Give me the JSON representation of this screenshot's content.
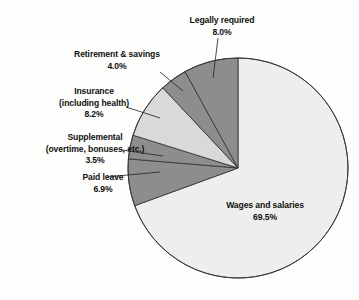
{
  "chart_data": {
    "type": "pie",
    "title": "",
    "subtitle": "",
    "xlabel": "",
    "ylabel": "",
    "legend_position": "none",
    "grid": false,
    "start_angle_deg": 0,
    "direction": "clockwise",
    "units": "percent of total compensation",
    "categories": [
      "Wages and salaries",
      "Paid leave",
      "Supplemental (overtime, bonuses, etc.)",
      "Insurance (including health)",
      "Retirement & savings",
      "Legally required"
    ],
    "values": [
      69.5,
      6.9,
      3.5,
      8.2,
      4.0,
      8.0
    ],
    "slices": [
      {
        "name": "Wages and salaries",
        "value": 69.5,
        "value_label": "69.5%",
        "label_line1": "Wages and salaries",
        "label_line2": "",
        "label_line3": "69.5%",
        "color": "#eeeeee",
        "label_placement": "inside",
        "label_x": 265,
        "label_y": 208,
        "leader": null
      },
      {
        "name": "Paid leave",
        "value": 6.9,
        "value_label": "6.9%",
        "label_line1": "Paid leave",
        "label_line2": "",
        "label_line3": "6.9%",
        "color": "#8d8d8d",
        "label_placement": "outside-left",
        "label_x": 103,
        "label_y": 180,
        "leader": {
          "x1": 107,
          "y1": 177,
          "x2": 160,
          "y2": 172
        }
      },
      {
        "name": "Supplemental",
        "value": 3.5,
        "value_label": "3.5%",
        "label_line1": "Supplemental",
        "label_line2": "(overtime, bonuses, etc.)",
        "label_line3": "3.5%",
        "color": "#8d8d8d",
        "label_placement": "outside-left",
        "label_x": 95,
        "label_y": 140,
        "leader": {
          "x1": 122,
          "y1": 150,
          "x2": 163,
          "y2": 156
        }
      },
      {
        "name": "Insurance (including health)",
        "value": 8.2,
        "value_label": "8.2%",
        "label_line1": "Insurance",
        "label_line2": "(including health)",
        "label_line3": "8.2%",
        "color": "#d9d9d9",
        "label_placement": "outside-left",
        "label_x": 94,
        "label_y": 94,
        "leader": {
          "x1": 126,
          "y1": 107,
          "x2": 160,
          "y2": 118
        }
      },
      {
        "name": "Retirement & savings",
        "value": 4.0,
        "value_label": "4.0%",
        "label_line1": "Retirement & savings",
        "label_line2": "",
        "label_line3": "4.0%",
        "color": "#8d8d8d",
        "label_placement": "outside-left",
        "label_x": 117,
        "label_y": 57,
        "leader": {
          "x1": 160,
          "y1": 72,
          "x2": 183,
          "y2": 91
        }
      },
      {
        "name": "Legally required",
        "value": 8.0,
        "value_label": "8.0%",
        "label_line1": "Legally required",
        "label_line2": "",
        "label_line3": "8.0%",
        "color": "#8d8d8d",
        "label_placement": "outside-top",
        "label_x": 222,
        "label_y": 23,
        "leader": {
          "x1": 218,
          "y1": 38,
          "x2": 213,
          "y2": 78
        }
      }
    ],
    "total": 100.1,
    "geometry": {
      "cx": 238,
      "cy": 168,
      "r": 110
    },
    "colors": {
      "light": "#eeeeee",
      "midlight": "#d9d9d9",
      "dark": "#8d8d8d",
      "outline": "#3a3a3a",
      "background": "#fdfdfb",
      "text": "#111111"
    }
  }
}
